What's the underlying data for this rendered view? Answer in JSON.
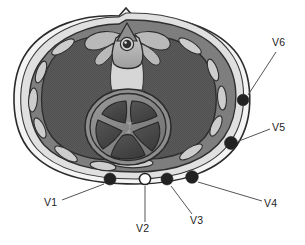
{
  "figure": {
    "name": "thorax-cross-section-precordial-lead-placement",
    "background_color": "#ffffff",
    "width": 305,
    "height": 245
  },
  "palette": {
    "outline": "#2b2b2b",
    "skin_outer": "#f2f2f2",
    "subcutaneous": "#dcdcdc",
    "chest_wall": "#808080",
    "rib": "#c9c9c9",
    "lung": "#5a5a5a",
    "lung_texture": "#4f4f4f",
    "mediastinum": "#9a9a9a",
    "esophagus_light": "#d3d3d3",
    "vertebra": "#b5b5b5",
    "spinal_cord": "#2f2f2f",
    "heart_wall": "#8a8a8a",
    "heart_chamber": "#4a4a4a",
    "heart_septum": "#a0a0a0",
    "sternum": "#cfcfcf",
    "electrode_filled": "#222222",
    "electrode_open": "#ffffff",
    "leader_line": "#555555",
    "label_text": "#1d1d1d"
  },
  "anatomy": {
    "outer_body_label": "chest-wall-outline",
    "left_lung_label": "left-lung",
    "right_lung_label": "right-lung",
    "heart_label": "heart",
    "vertebra_label": "thoracic-vertebra",
    "spinal_cord_label": "spinal-cord",
    "sternum_label": "sternum",
    "mediastinum_label": "mediastinum",
    "rib_count_left": 5,
    "rib_count_right": 5
  },
  "electrodes": [
    {
      "id": "V1",
      "label": "V1",
      "style": "filled",
      "cx": 110,
      "cy": 179,
      "r": 6.0,
      "label_x": 44,
      "label_y": 206,
      "leader": {
        "x1": 62,
        "y1": 200,
        "x2": 104,
        "y2": 184
      }
    },
    {
      "id": "V2",
      "label": "V2",
      "style": "open",
      "cx": 145,
      "cy": 179,
      "r": 5.6,
      "label_x": 136,
      "label_y": 232,
      "leader": {
        "x1": 145,
        "y1": 186,
        "x2": 145,
        "y2": 222
      }
    },
    {
      "id": "V3",
      "label": "V3",
      "style": "filled",
      "cx": 167,
      "cy": 179,
      "r": 6.0,
      "label_x": 190,
      "label_y": 224,
      "leader": {
        "x1": 171,
        "y1": 186,
        "x2": 192,
        "y2": 214
      }
    },
    {
      "id": "V4",
      "label": "V4",
      "style": "filled",
      "cx": 192,
      "cy": 177,
      "r": 6.3,
      "label_x": 264,
      "label_y": 207,
      "leader": {
        "x1": 198,
        "y1": 182,
        "x2": 262,
        "y2": 201
      }
    },
    {
      "id": "V5",
      "label": "V5",
      "style": "filled",
      "cx": 231,
      "cy": 143,
      "r": 6.5,
      "label_x": 272,
      "label_y": 131,
      "leader": {
        "x1": 239,
        "y1": 141,
        "x2": 270,
        "y2": 129
      }
    },
    {
      "id": "V6",
      "label": "V6",
      "style": "filled",
      "cx": 243,
      "cy": 100,
      "r": 5.8,
      "label_x": 272,
      "label_y": 46,
      "leader": {
        "x1": 248,
        "y1": 95,
        "x2": 276,
        "y2": 52
      }
    }
  ]
}
